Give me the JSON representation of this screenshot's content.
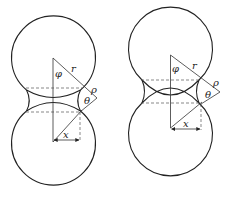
{
  "figure": {
    "panels": [
      {
        "id": "left",
        "description": "Two touching spheres with concave neck (initial sintering stage)",
        "labels": {
          "phi": "φ",
          "r": "r",
          "rho": "ρ",
          "theta": "θ",
          "x": "x"
        }
      },
      {
        "id": "right",
        "description": "Two overlapping spheres with neck (center approach, shrinkage)",
        "labels": {
          "phi": "φ",
          "r": "r",
          "rho": "ρ",
          "theta": "θ",
          "x": "x"
        }
      }
    ],
    "colors": {
      "line": "#222222",
      "dashed": "#555555",
      "background": "#ffffff"
    }
  }
}
